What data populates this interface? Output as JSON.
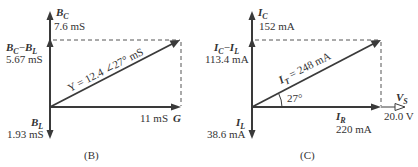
{
  "panels": [
    {
      "id": "B",
      "caption": "(B)",
      "vertical_top": {
        "symbol": "B",
        "sub": "C",
        "value": "7.6 mS"
      },
      "vertical_net": {
        "symbol1": "B",
        "sub1": "C",
        "op": "−",
        "symbol2": "B",
        "sub2": "L",
        "value": "5.67 mS"
      },
      "vertical_bottom": {
        "symbol": "B",
        "sub": "L",
        "value": "1.93 mS"
      },
      "horizontal": {
        "symbol": "G",
        "value": "11 mS"
      },
      "resultant": {
        "label": "Y = 12.4 ∠27° mS"
      }
    },
    {
      "id": "C",
      "caption": "(C)",
      "vertical_top": {
        "symbol": "I",
        "sub": "C",
        "value": "152 mA"
      },
      "vertical_net": {
        "symbol1": "I",
        "sub1": "C",
        "op": "−",
        "symbol2": "I",
        "sub2": "L",
        "value": "113.4 mA"
      },
      "vertical_bottom": {
        "symbol": "I",
        "sub": "L",
        "value": "38.6 mA"
      },
      "horizontal": {
        "symbol": "I",
        "sub": "R",
        "value": "220 mA"
      },
      "reference": {
        "symbol": "V",
        "sub": "S",
        "value": "20.0 V"
      },
      "resultant": {
        "symbol": "I",
        "sub": "T",
        "label": " = 248 mA"
      },
      "angle": "27°"
    }
  ],
  "colors": {
    "line": "#3a3a3a",
    "text": "#333333",
    "background": "#ffffff"
  }
}
